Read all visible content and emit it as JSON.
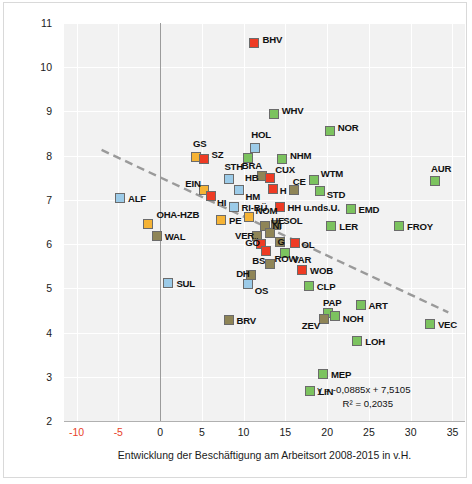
{
  "chart_data": {
    "type": "scatter",
    "title": "",
    "xlabel": "Entwicklung der Beschäftigung am Arbeitsort 2008-2015 in v.H.",
    "ylabel": "Arbeitslosenquote (JD) 2015",
    "xlim": [
      -11.5,
      36.5
    ],
    "ylim": [
      2,
      11
    ],
    "xticks": [
      "-10",
      "-5",
      "0",
      "5",
      "10",
      "15",
      "20",
      "25",
      "30",
      "35"
    ],
    "xtick_values": [
      -10,
      -5,
      0,
      5,
      10,
      15,
      20,
      25,
      30,
      35
    ],
    "negative_tick_color": "#e8442a",
    "yticks": [
      "11",
      "10",
      "9",
      "8",
      "7",
      "6",
      "5",
      "4",
      "3",
      "2"
    ],
    "ytick_values": [
      11,
      10,
      9,
      8,
      7,
      6,
      5,
      4,
      3,
      2
    ],
    "grid": true,
    "legend": "none",
    "zero_reference_line_x": 0,
    "trendline": {
      "equation": "y = -0,0885x + 7,5105",
      "r2": "R² = 0,2035",
      "slope": -0.0885,
      "intercept": 7.5105,
      "style": "dashed",
      "color": "#9a9a9a",
      "x_start": -7.0,
      "x_end": 34.5
    },
    "marker_colors": {
      "green": "#7cc35f",
      "red": "#ee3b24",
      "blue": "#9ccbe8",
      "orange": "#f5b335",
      "olive": "#8f8557"
    },
    "points": [
      {
        "label": "BHV",
        "x": 11.3,
        "y": 10.55,
        "color": "red",
        "lx": 8,
        "ly": -4
      },
      {
        "label": "WHV",
        "x": 13.6,
        "y": 8.95,
        "color": "green",
        "lx": 8,
        "ly": -4
      },
      {
        "label": "NOR",
        "x": 20.3,
        "y": 8.55,
        "color": "green",
        "lx": 8,
        "ly": -4
      },
      {
        "label": "HOL",
        "x": 11.4,
        "y": 8.18,
        "color": "blue",
        "lx": -4,
        "ly": -14
      },
      {
        "label": "GS",
        "x": 4.3,
        "y": 7.96,
        "color": "orange",
        "lx": -3,
        "ly": -14
      },
      {
        "label": "SZ",
        "x": 5.2,
        "y": 7.92,
        "color": "red",
        "lx": 8,
        "ly": -5
      },
      {
        "label": "BRA",
        "x": 10.5,
        "y": 7.95,
        "color": "green",
        "lx": -6,
        "ly": 7
      },
      {
        "label": "NHM",
        "x": 14.6,
        "y": 7.93,
        "color": "green",
        "lx": 8,
        "ly": -4
      },
      {
        "label": "STH",
        "x": 8.3,
        "y": 7.47,
        "color": "blue",
        "lx": -5,
        "ly": -13
      },
      {
        "label": "HB",
        "x": 12.2,
        "y": 7.53,
        "color": "olive",
        "lx": -17,
        "ly": 1
      },
      {
        "label": "CUX",
        "x": 13.2,
        "y": 7.49,
        "color": "red",
        "lx": 5,
        "ly": -9
      },
      {
        "label": "WTM",
        "x": 18.4,
        "y": 7.45,
        "color": "green",
        "lx": 7,
        "ly": -7
      },
      {
        "label": "EIN",
        "x": 5.3,
        "y": 7.22,
        "color": "orange",
        "lx": -19,
        "ly": -7
      },
      {
        "label": "HI",
        "x": 6.1,
        "y": 7.08,
        "color": "red",
        "lx": 6,
        "ly": 6
      },
      {
        "label": "HM",
        "x": 9.5,
        "y": 7.22,
        "color": "blue",
        "lx": 6,
        "ly": 6
      },
      {
        "label": "H",
        "x": 13.5,
        "y": 7.25,
        "color": "red",
        "lx": 7,
        "ly": 1
      },
      {
        "label": "CE",
        "x": 16.0,
        "y": 7.22,
        "color": "olive",
        "lx": -1,
        "ly": -9
      },
      {
        "label": "STD",
        "x": 19.1,
        "y": 7.2,
        "color": "green",
        "lx": 7,
        "ly": 3
      },
      {
        "label": "ALF",
        "x": -4.8,
        "y": 7.05,
        "color": "blue",
        "lx": 8,
        "ly": 0
      },
      {
        "label": "RI-BÜ",
        "x": 8.8,
        "y": 6.85,
        "color": "blue",
        "lx": 8,
        "ly": 0
      },
      {
        "label": "HH u.nds.U.",
        "x": 14.3,
        "y": 6.83,
        "color": "red",
        "lx": 8,
        "ly": 0
      },
      {
        "label": "EMD",
        "x": 22.8,
        "y": 6.8,
        "color": "green",
        "lx": 8,
        "ly": 0
      },
      {
        "label": "NOM",
        "x": 10.7,
        "y": 6.62,
        "color": "orange",
        "lx": 6,
        "ly": -7
      },
      {
        "label": "OHA-HZB",
        "x": -1.4,
        "y": 6.45,
        "color": "orange",
        "lx": 8,
        "ly": -10
      },
      {
        "label": "PE",
        "x": 7.3,
        "y": 6.55,
        "color": "orange",
        "lx": 8,
        "ly": 0
      },
      {
        "label": "SOL",
        "x": 13.9,
        "y": 6.44,
        "color": "olive",
        "lx": 7,
        "ly": -5
      },
      {
        "label": "LER",
        "x": 20.5,
        "y": 6.42,
        "color": "green",
        "lx": 8,
        "ly": 0
      },
      {
        "label": "UE",
        "x": 12.6,
        "y": 6.4,
        "color": "olive",
        "lx": 6,
        "ly": -6
      },
      {
        "label": "WAL",
        "x": -0.4,
        "y": 6.18,
        "color": "olive",
        "lx": 8,
        "ly": 0
      },
      {
        "label": "VER",
        "x": 11.6,
        "y": 6.18,
        "color": "olive",
        "lx": -22,
        "ly": -1
      },
      {
        "label": "NI",
        "x": 13.1,
        "y": 6.25,
        "color": "olive",
        "lx": 3,
        "ly": -8
      },
      {
        "label": "GÖ",
        "x": 12.1,
        "y": 6.0,
        "color": "red",
        "lx": -16,
        "ly": -2
      },
      {
        "label": "G",
        "x": 14.3,
        "y": 6.05,
        "color": "olive",
        "lx": -2,
        "ly": -1
      },
      {
        "label": "OL",
        "x": 16.1,
        "y": 6.03,
        "color": "red",
        "lx": 7,
        "ly": 1
      },
      {
        "label": "BS",
        "x": 12.7,
        "y": 5.85,
        "color": "red",
        "lx": -14,
        "ly": 9
      },
      {
        "label": "VAR",
        "x": 15.0,
        "y": 5.8,
        "color": "green",
        "lx": 7,
        "ly": 6
      },
      {
        "label": "ROW",
        "x": 13.1,
        "y": 5.55,
        "color": "olive",
        "lx": 5,
        "ly": -6
      },
      {
        "label": "WOB",
        "x": 17.0,
        "y": 5.42,
        "color": "red",
        "lx": 8,
        "ly": 0
      },
      {
        "label": "DH",
        "x": 10.9,
        "y": 5.3,
        "color": "olive",
        "lx": -15,
        "ly": -2
      },
      {
        "label": "OS",
        "x": 10.5,
        "y": 5.1,
        "color": "blue",
        "lx": 7,
        "ly": 6
      },
      {
        "label": "SUL",
        "x": 1.0,
        "y": 5.13,
        "color": "blue",
        "lx": 8,
        "ly": 0
      },
      {
        "label": "CLP",
        "x": 17.8,
        "y": 5.05,
        "color": "green",
        "lx": 8,
        "ly": 0
      },
      {
        "label": "ART",
        "x": 24.0,
        "y": 4.62,
        "color": "green",
        "lx": 8,
        "ly": 0
      },
      {
        "label": "PAP",
        "x": 20.1,
        "y": 4.45,
        "color": "green",
        "lx": -5,
        "ly": -11
      },
      {
        "label": "NOH",
        "x": 20.9,
        "y": 4.37,
        "color": "green",
        "lx": 8,
        "ly": 2
      },
      {
        "label": "ZEV",
        "x": 19.6,
        "y": 4.3,
        "color": "olive",
        "lx": -22,
        "ly": 6
      },
      {
        "label": "BRV",
        "x": 8.2,
        "y": 4.28,
        "color": "olive",
        "lx": 8,
        "ly": 0
      },
      {
        "label": "VEC",
        "x": 32.3,
        "y": 4.2,
        "color": "green",
        "lx": 8,
        "ly": 0
      },
      {
        "label": "AUR",
        "x": 32.9,
        "y": 7.42,
        "color": "green",
        "lx": -4,
        "ly": -13
      },
      {
        "label": "FROY",
        "x": 28.6,
        "y": 6.42,
        "color": "green",
        "lx": 8,
        "ly": 0
      },
      {
        "label": "LOH",
        "x": 23.6,
        "y": 3.82,
        "color": "green",
        "lx": 8,
        "ly": 0
      },
      {
        "label": "MEP",
        "x": 19.5,
        "y": 3.07,
        "color": "green",
        "lx": 8,
        "ly": 0
      },
      {
        "label": "LIN",
        "x": 18.0,
        "y": 2.67,
        "color": "green",
        "lx": 8,
        "ly": 0
      }
    ]
  }
}
